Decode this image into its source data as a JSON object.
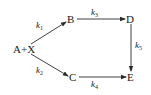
{
  "diagram": {
    "type": "reaction-scheme",
    "nodes": [
      {
        "id": "AX",
        "label": "A+X"
      },
      {
        "id": "B",
        "label": "B"
      },
      {
        "id": "C",
        "label": "C"
      },
      {
        "id": "D",
        "label": "D"
      },
      {
        "id": "E",
        "label": "E"
      }
    ],
    "edges": [
      {
        "from": "A+X",
        "to": "B",
        "rate": "k",
        "sub": "1"
      },
      {
        "from": "A+X",
        "to": "C",
        "rate": "k",
        "sub": "2"
      },
      {
        "from": "B",
        "to": "D",
        "rate": "k",
        "sub": "3"
      },
      {
        "from": "C",
        "to": "E",
        "rate": "k",
        "sub": "4"
      },
      {
        "from": "D",
        "to": "E",
        "rate": "k",
        "sub": "5"
      }
    ]
  },
  "colors": {
    "line": "#2a2a2a",
    "text": "#1a1a1a",
    "background": "#ffffff"
  }
}
